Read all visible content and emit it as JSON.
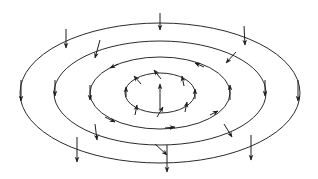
{
  "diagram": {
    "type": "vector-field",
    "center": [
      160,
      93
    ],
    "stroke_color": "#2b2b2b",
    "background": "#ffffff",
    "rings": [
      {
        "id": "ring-1",
        "rx": 140,
        "ry": 70
      },
      {
        "id": "ring-2",
        "rx": 106,
        "ry": 52
      },
      {
        "id": "ring-3",
        "rx": 70,
        "ry": 36
      },
      {
        "id": "ring-4",
        "rx": 35,
        "ry": 20
      }
    ],
    "arrows": [
      {
        "ring": "ring-1",
        "x1": 66,
        "y1": 29,
        "x2": 66,
        "y2": 48
      },
      {
        "ring": "ring-1",
        "x1": 160,
        "y1": 13,
        "x2": 160,
        "y2": 30
      },
      {
        "ring": "ring-1",
        "x1": 244,
        "y1": 26,
        "x2": 245,
        "y2": 45
      },
      {
        "ring": "ring-1",
        "x1": 21,
        "y1": 80,
        "x2": 21,
        "y2": 101
      },
      {
        "ring": "ring-1",
        "x1": 298,
        "y1": 80,
        "x2": 298,
        "y2": 101
      },
      {
        "ring": "ring-1",
        "x1": 77,
        "y1": 137,
        "x2": 77,
        "y2": 162
      },
      {
        "ring": "ring-1",
        "x1": 167,
        "y1": 145,
        "x2": 167,
        "y2": 172
      },
      {
        "ring": "ring-1",
        "x1": 251,
        "y1": 135,
        "x2": 251,
        "y2": 160
      },
      {
        "ring": "ring-2",
        "x1": 100,
        "y1": 40,
        "x2": 95,
        "y2": 58
      },
      {
        "ring": "ring-2",
        "x1": 236,
        "y1": 52,
        "x2": 226,
        "y2": 63
      },
      {
        "ring": "ring-2",
        "x1": 55,
        "y1": 80,
        "x2": 55,
        "y2": 96
      },
      {
        "ring": "ring-2",
        "x1": 265,
        "y1": 80,
        "x2": 265,
        "y2": 96
      },
      {
        "ring": "ring-2",
        "x1": 95,
        "y1": 124,
        "x2": 97,
        "y2": 140
      },
      {
        "ring": "ring-2",
        "x1": 224,
        "y1": 124,
        "x2": 232,
        "y2": 137
      },
      {
        "ring": "ring-2",
        "x1": 155,
        "y1": 144,
        "x2": 167,
        "y2": 155
      },
      {
        "ring": "ring-3",
        "x1": 204,
        "y1": 67,
        "x2": 195,
        "y2": 63
      },
      {
        "ring": "ring-3",
        "x1": 118,
        "y1": 64,
        "x2": 110,
        "y2": 68
      },
      {
        "ring": "ring-3",
        "x1": 90,
        "y1": 85,
        "x2": 90,
        "y2": 100
      },
      {
        "ring": "ring-3",
        "x1": 230,
        "y1": 100,
        "x2": 230,
        "y2": 85
      },
      {
        "ring": "ring-3",
        "x1": 105,
        "y1": 117,
        "x2": 115,
        "y2": 122
      },
      {
        "ring": "ring-3",
        "x1": 165,
        "y1": 128,
        "x2": 175,
        "y2": 127
      },
      {
        "ring": "ring-3",
        "x1": 210,
        "y1": 115,
        "x2": 218,
        "y2": 111
      },
      {
        "ring": "ring-4",
        "x1": 161,
        "y1": 79,
        "x2": 154,
        "y2": 70
      },
      {
        "ring": "ring-4",
        "x1": 141,
        "y1": 84,
        "x2": 134,
        "y2": 76
      },
      {
        "ring": "ring-4",
        "x1": 184,
        "y1": 86,
        "x2": 182,
        "y2": 76
      },
      {
        "ring": "ring-4",
        "x1": 126,
        "y1": 97,
        "x2": 126,
        "y2": 87
      },
      {
        "ring": "ring-4",
        "x1": 195,
        "y1": 99,
        "x2": 195,
        "y2": 89
      },
      {
        "ring": "ring-4",
        "x1": 135,
        "y1": 115,
        "x2": 137,
        "y2": 105
      },
      {
        "ring": "ring-4",
        "x1": 157,
        "y1": 117,
        "x2": 163,
        "y2": 107
      },
      {
        "ring": "ring-4",
        "x1": 185,
        "y1": 112,
        "x2": 187,
        "y2": 102
      },
      {
        "ring": "center",
        "x1": 160,
        "y1": 110,
        "x2": 160,
        "y2": 84
      }
    ]
  }
}
